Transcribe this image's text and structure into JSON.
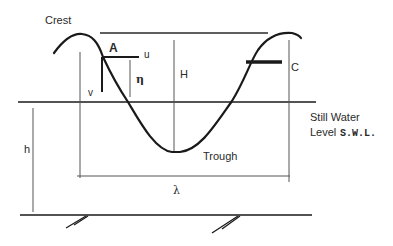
{
  "diagram": {
    "labels": {
      "crest": "Crest",
      "trough": "Trough",
      "point_a": "A",
      "u": "u",
      "v": "v",
      "eta": "η",
      "wave_height": "H",
      "celerity": "C",
      "depth": "h",
      "wavelength": "λ",
      "swl_line1": "Still Water",
      "swl_line2_prefix": "Level",
      "swl_abbrev": "S.W.L."
    },
    "colors": {
      "ink": "#1a1a1a",
      "thin_line": "#555555",
      "background": "#ffffff"
    }
  }
}
